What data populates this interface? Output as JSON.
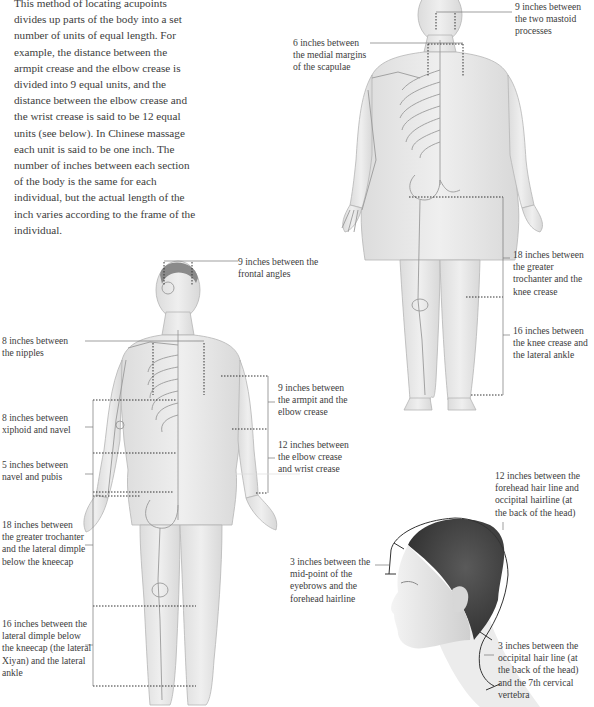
{
  "intro_text": "This method of locating acupoints divides up parts of the body into a set number of units of equal length. For example, the distance between the armpit crease and the elbow crease is divided into 9 equal units, and the distance between the elbow crease and the wrist crease is said to be 12 equal units (see below). In Chinese massage each unit is said to be one inch. The number of inches between each section of the body is the same for each individual, but the actual length of the inch varies according to the frame of the individual.",
  "back_figure": {
    "labels": {
      "mastoid": "9 inches between the two mastoid processes",
      "scapulae": "6 inches between the medial margins of the scapulae",
      "trochanter_knee": "18 inches between the greater trochanter and the knee crease",
      "knee_ankle": "16 inches between the knee crease and the lateral ankle"
    }
  },
  "front_figure": {
    "labels": {
      "frontal_angles": "9 inches between the frontal angles",
      "nipples": "8 inches between the nipples",
      "xiphoid_navel": "8 inches between xiphoid and navel",
      "navel_pubis": "5 inches between navel and pubis",
      "armpit_elbow": "9 inches between the armpit and the elbow crease",
      "elbow_wrist": "12 inches between the elbow crease and wrist crease",
      "trochanter_dimple": "18 inches between the greater trochanter and the lateral dimple below the kneecap",
      "dimple_ankle": "16 inches between the lateral dimple below the kneecap (the lateral Xiyan) and the lateral ankle"
    }
  },
  "head_figure": {
    "labels": {
      "hairline_occipital": "12 inches between the forehead hair line and occipital hairline (at the back of the head)",
      "eyebrows_hairline": "3 inches between the mid-point of the eyebrows and the forehead hairline",
      "occipital_c7": "3 inches between the occipital hair line (at the back of the head) and the 7th cervical vertebra"
    }
  },
  "colors": {
    "skin": "#e9e9e9",
    "skin_shade": "#d4d4d4",
    "bone": "#bdbdbd",
    "hair": "#4a4a4a",
    "line": "#555555",
    "text": "#3c3c3c"
  }
}
